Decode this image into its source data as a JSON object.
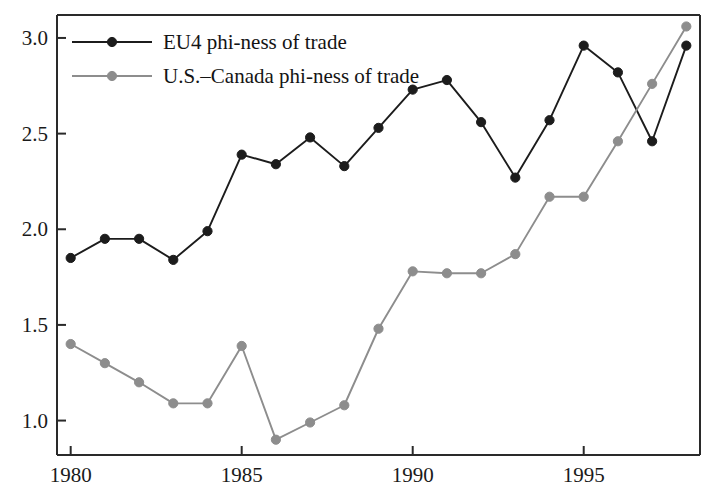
{
  "chart_data": {
    "type": "line",
    "title": "",
    "subtitle": "",
    "xlabel": "",
    "ylabel": "",
    "xlim": [
      1979.6,
      1998.4
    ],
    "ylim": [
      0.82,
      3.12
    ],
    "grid": false,
    "legend_position": "top-left inside",
    "x": [
      1980,
      1981,
      1982,
      1983,
      1984,
      1985,
      1986,
      1987,
      1988,
      1989,
      1990,
      1991,
      1992,
      1993,
      1994,
      1995,
      1996,
      1997,
      1998
    ],
    "xticks": [
      1980,
      1985,
      1990,
      1995
    ],
    "xtick_labels": [
      "1980",
      "1985",
      "1990",
      "1995"
    ],
    "yticks": [
      1.0,
      1.5,
      2.0,
      2.5,
      3.0
    ],
    "ytick_labels": [
      "1.0",
      "1.5",
      "2.0",
      "2.5",
      "3.0"
    ],
    "series": [
      {
        "name": "EU4 phi-ness of trade",
        "color": "#1c1c1c",
        "marker": "circle",
        "values": [
          1.85,
          1.95,
          1.95,
          1.84,
          1.99,
          2.39,
          2.34,
          2.48,
          2.33,
          2.53,
          2.73,
          2.78,
          2.56,
          2.27,
          2.57,
          2.96,
          2.82,
          2.46,
          2.96
        ]
      },
      {
        "name": "U.S.–Canada phi-ness of trade",
        "color": "#8d8d8d",
        "marker": "circle",
        "values": [
          1.4,
          1.3,
          1.2,
          1.09,
          1.09,
          1.39,
          0.9,
          0.99,
          1.08,
          1.48,
          1.78,
          1.77,
          1.77,
          1.87,
          2.17,
          2.17,
          2.46,
          2.76,
          3.06
        ]
      }
    ]
  },
  "legend": {
    "entries": [
      {
        "label": "EU4 phi-ness of trade",
        "color": "#1c1c1c"
      },
      {
        "label": "U.S.–Canada phi-ness of trade",
        "color": "#8d8d8d"
      }
    ]
  },
  "axes": {
    "y_labels": [
      "3.0",
      "2.5",
      "2.0",
      "1.5",
      "1.0"
    ],
    "x_labels": [
      "1980",
      "1985",
      "1990",
      "1995"
    ]
  }
}
